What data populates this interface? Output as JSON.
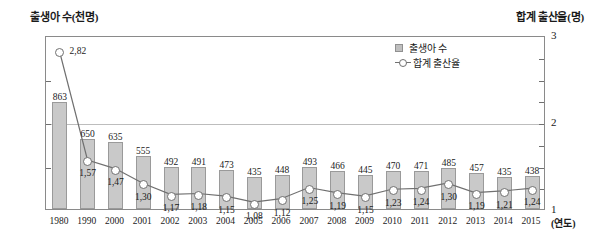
{
  "chart_data": {
    "type": "bar",
    "title": "",
    "xlabel": "(연도)",
    "left_axis_title": "출생아 수(천명)",
    "right_axis_title": "합계 출산율(명)",
    "categories": [
      "1980",
      "1990",
      "2000",
      "2001",
      "2002",
      "2003",
      "2004",
      "2005",
      "2006",
      "2007",
      "2008",
      "2009",
      "2010",
      "2011",
      "2012",
      "2013",
      "2014",
      "2015"
    ],
    "ylim": [
      250,
      1250
    ],
    "y2lim": [
      1,
      3
    ],
    "left_ticks": [
      "1,250",
      "750",
      "250"
    ],
    "right_ticks": [
      "3",
      "2",
      "1"
    ],
    "grid": true,
    "legend_position": "top-right",
    "series": [
      {
        "name": "출생아 수",
        "type": "bar",
        "axis": "left",
        "unit": "천명",
        "color": "#c9c9c9",
        "values": [
          863,
          650,
          635,
          555,
          492,
          491,
          473,
          435,
          448,
          493,
          466,
          445,
          470,
          471,
          485,
          457,
          435,
          438
        ],
        "labels": [
          "863",
          "650",
          "635",
          "555",
          "492",
          "491",
          "473",
          "435",
          "448",
          "493",
          "466",
          "445",
          "470",
          "471",
          "485",
          "457",
          "435",
          "438"
        ]
      },
      {
        "name": "합계 출산율",
        "type": "line",
        "axis": "right",
        "unit": "명",
        "color": "#707070",
        "values": [
          2.82,
          1.57,
          1.47,
          1.3,
          1.17,
          1.18,
          1.15,
          1.08,
          1.12,
          1.25,
          1.19,
          1.15,
          1.23,
          1.24,
          1.3,
          1.19,
          1.21,
          1.24
        ],
        "labels": [
          "2,82",
          "1,57",
          "1,47",
          "1,30",
          "1,17",
          "1,18",
          "1,15",
          "1,08",
          "1,12",
          "1,25",
          "1,19",
          "1,15",
          "1,23",
          "1,24",
          "1,30",
          "1,19",
          "1,21",
          "1,24"
        ]
      }
    ]
  },
  "legend": {
    "items": [
      {
        "label": "출생아 수",
        "marker": "bar-swatch"
      },
      {
        "label": "합계 출산율",
        "marker": "line-circle-swatch"
      }
    ]
  }
}
